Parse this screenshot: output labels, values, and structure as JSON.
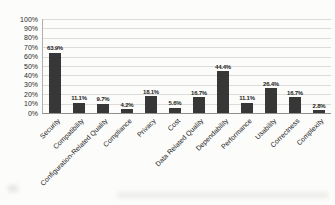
{
  "chart_data": {
    "type": "bar",
    "title": "",
    "xlabel": "",
    "ylabel": "",
    "categories": [
      "Security",
      "Compatibility",
      "Configuration-Related Quality",
      "Compliance",
      "Privacy",
      "Cost",
      "Data Related Quality",
      "Dependability",
      "Performance",
      "Usability",
      "Correctness",
      "Complexity"
    ],
    "values": [
      63.9,
      11.1,
      9.7,
      4.2,
      18.1,
      5.6,
      16.7,
      44.4,
      11.1,
      26.4,
      16.7,
      2.8
    ],
    "value_labels": [
      "63.9%",
      "11.1%",
      "9.7%",
      "4.2%",
      "18.1%",
      "5.6%",
      "16.7%",
      "44.4%",
      "11.1%",
      "26.4%",
      "16.7%",
      "2.8%"
    ],
    "ylim": [
      0,
      100
    ],
    "ytick_labels": [
      "0%",
      "10%",
      "20%",
      "30%",
      "40%",
      "50%",
      "60%",
      "70%",
      "80%",
      "90%",
      "100%"
    ],
    "grid": true,
    "legend": false,
    "bar_color": "#373737",
    "gridline_color": "#dcdcda",
    "axis_text_color": "#2b2b2b",
    "value_label_color": "#1c1c1c"
  }
}
